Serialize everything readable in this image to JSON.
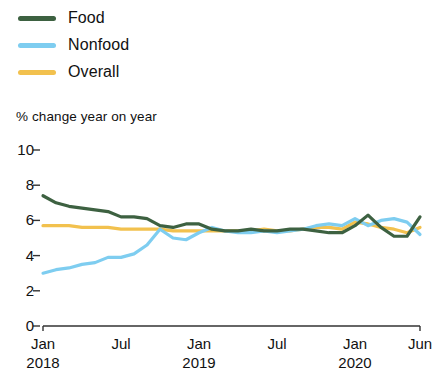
{
  "legend": {
    "position": "top-left",
    "items": [
      {
        "label": "Food",
        "color": "#3d6141"
      },
      {
        "label": "Nonfood",
        "color": "#7ecdf0"
      },
      {
        "label": "Overall",
        "color": "#f2c14e"
      }
    ]
  },
  "chart_data": {
    "type": "line",
    "title": "",
    "subtitle": "",
    "ylabel": "% change year on year",
    "xlabel": "",
    "ylim": [
      0,
      10
    ],
    "yticks": [
      0,
      2,
      4,
      6,
      8,
      10
    ],
    "ytick_labels": [
      "0",
      "2",
      "4",
      "6",
      "8",
      "10"
    ],
    "grid": false,
    "x": [
      "Jan 2018",
      "Feb 2018",
      "Mar 2018",
      "Apr 2018",
      "May 2018",
      "Jun 2018",
      "Jul 2018",
      "Aug 2018",
      "Sep 2018",
      "Oct 2018",
      "Nov 2018",
      "Dec 2018",
      "Jan 2019",
      "Feb 2019",
      "Mar 2019",
      "Apr 2019",
      "May 2019",
      "Jun 2019",
      "Jul 2019",
      "Aug 2019",
      "Sep 2019",
      "Oct 2019",
      "Nov 2019",
      "Dec 2019",
      "Jan 2020",
      "Feb 2020",
      "Mar 2020",
      "Apr 2020",
      "May 2020",
      "Jun 2020"
    ],
    "xticks": [
      {
        "index": 0,
        "label": "Jan",
        "year": "2018"
      },
      {
        "index": 6,
        "label": "Jul",
        "year": ""
      },
      {
        "index": 12,
        "label": "Jan",
        "year": "2019"
      },
      {
        "index": 18,
        "label": "Jul",
        "year": ""
      },
      {
        "index": 24,
        "label": "Jan",
        "year": "2020"
      },
      {
        "index": 29,
        "label": "Jun",
        "year": ""
      }
    ],
    "series": [
      {
        "name": "Food",
        "color": "#3d6141",
        "values": [
          7.4,
          7.0,
          6.8,
          6.7,
          6.6,
          6.5,
          6.2,
          6.2,
          6.1,
          5.7,
          5.6,
          5.8,
          5.8,
          5.5,
          5.4,
          5.4,
          5.5,
          5.4,
          5.4,
          5.5,
          5.5,
          5.4,
          5.3,
          5.3,
          5.7,
          6.3,
          5.6,
          5.1,
          5.1,
          6.2
        ]
      },
      {
        "name": "Nonfood",
        "color": "#7ecdf0",
        "values": [
          3.0,
          3.2,
          3.3,
          3.5,
          3.6,
          3.9,
          3.9,
          4.1,
          4.6,
          5.5,
          5.0,
          4.9,
          5.3,
          5.6,
          5.4,
          5.3,
          5.3,
          5.4,
          5.3,
          5.4,
          5.5,
          5.7,
          5.8,
          5.7,
          6.1,
          5.7,
          6.0,
          6.1,
          5.9,
          5.2
        ]
      },
      {
        "name": "Overall",
        "color": "#f2c14e",
        "values": [
          5.7,
          5.7,
          5.7,
          5.6,
          5.6,
          5.6,
          5.5,
          5.5,
          5.5,
          5.5,
          5.4,
          5.4,
          5.4,
          5.4,
          5.4,
          5.4,
          5.4,
          5.5,
          5.4,
          5.4,
          5.5,
          5.6,
          5.6,
          5.5,
          5.9,
          5.8,
          5.6,
          5.5,
          5.3,
          5.6
        ]
      }
    ]
  }
}
